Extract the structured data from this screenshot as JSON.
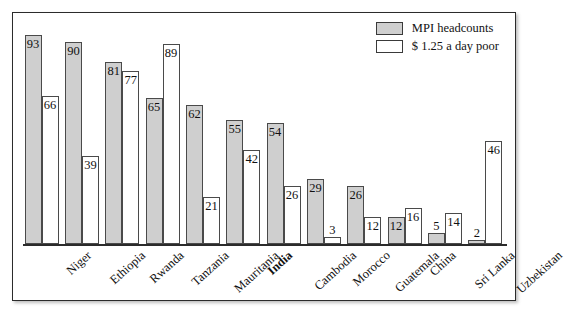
{
  "chart_data": {
    "type": "bar",
    "title": "",
    "subtitle": "",
    "xlabel": "",
    "ylabel": "",
    "ylim": [
      0,
      100
    ],
    "grid": false,
    "legend_position": "top-right",
    "categories": [
      "Niger",
      "Ethiopia",
      "Rwanda",
      "Tanzania",
      "Mauritania",
      "India",
      "Cambodia",
      "Morocco",
      "Guatemala",
      "China",
      "Sri Lanka",
      "Uzbekistan"
    ],
    "emphasized_categories": [
      "India"
    ],
    "series": [
      {
        "name": "MPI headcounts",
        "color": "#cfcfcf",
        "values": [
          93,
          90,
          81,
          65,
          62,
          55,
          54,
          29,
          26,
          12,
          5,
          2
        ]
      },
      {
        "name": "$ 1.25 a day poor",
        "color": "#ffffff",
        "values": [
          66,
          39,
          77,
          89,
          21,
          42,
          26,
          3,
          12,
          16,
          14,
          46
        ]
      }
    ]
  },
  "legend": {
    "items": [
      {
        "label": "MPI headcounts",
        "swatch": "gray"
      },
      {
        "label": "$ 1.25 a day poor",
        "swatch": "white"
      }
    ]
  }
}
